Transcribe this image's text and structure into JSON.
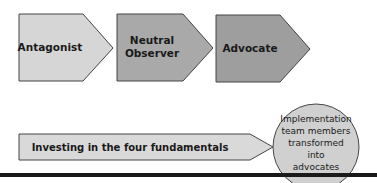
{
  "diagram": {
    "stages": [
      {
        "label_lines": [
          "Antagonist"
        ],
        "fill": "#d6d6d6"
      },
      {
        "label_lines": [
          "Neutral",
          "Observer"
        ],
        "fill": "#a9a9a9"
      },
      {
        "label_lines": [
          "Advocate"
        ],
        "fill": "#9e9e9e"
      }
    ],
    "process_arrow": {
      "label": "Investing in the four fundamentals",
      "fill": "#d9d9d9"
    },
    "outcome": {
      "label_lines": [
        "Implementation",
        "team members",
        "transformed",
        "into",
        "advocates"
      ],
      "fill": "#d0d0d0"
    },
    "colors": {
      "stroke": "#444444",
      "rule": "#1a1a1a"
    }
  }
}
